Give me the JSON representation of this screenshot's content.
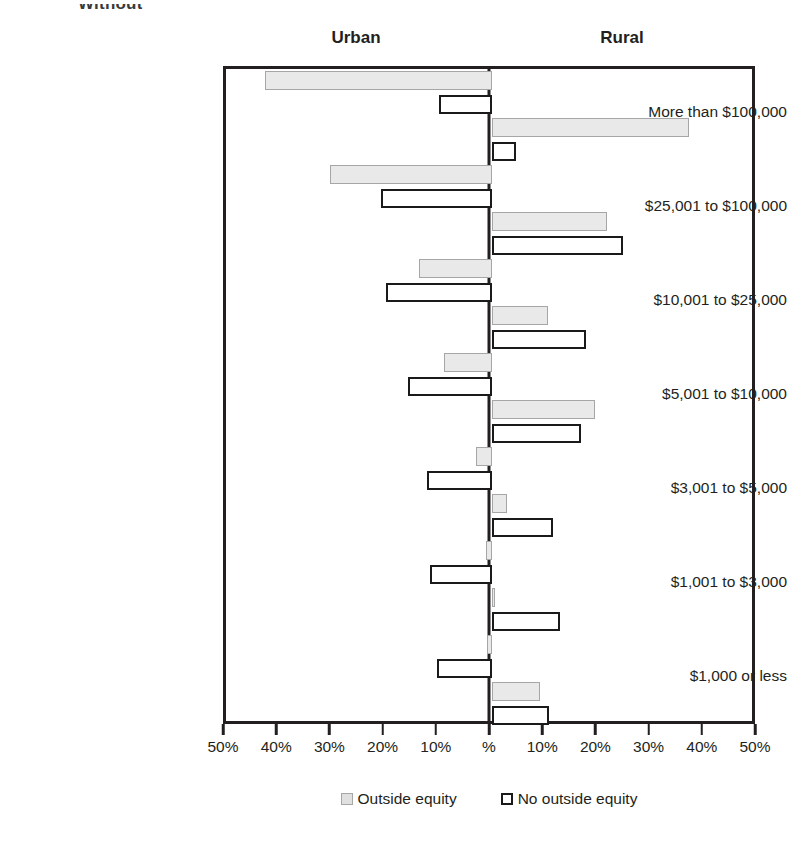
{
  "partial_title": "Without",
  "panels": {
    "left": "Urban",
    "right": "Rural"
  },
  "legend": [
    {
      "key": "outside_equity",
      "label": "Outside equity",
      "style": "gray"
    },
    {
      "key": "no_outside_equity",
      "label": "No outside equity",
      "style": "white"
    }
  ],
  "axis": {
    "ticks": [
      "50%",
      "40%",
      "30%",
      "20%",
      "10%",
      "%",
      "10%",
      "20%",
      "30%",
      "40%",
      "50%"
    ],
    "max": 50,
    "min": 0
  },
  "colors": {
    "outside_equity_fill": "#e9e9e9",
    "outside_equity_border": "#a6a6a6",
    "no_outside_equity_fill": "#ffffff",
    "no_outside_equity_border": "#1a1a1a",
    "frame": "#231f20",
    "text": "#231f20"
  },
  "chart_data": {
    "type": "bar",
    "orientation": "horizontal",
    "layout": "diverging-paired-panels",
    "title": "Without",
    "xlabel": "",
    "ylabel": "",
    "xlim": [
      -50,
      50
    ],
    "grid": false,
    "legend_position": "bottom",
    "panel_left": "Urban",
    "panel_right": "Rural",
    "categories": [
      "More than $100,000",
      "$25,001 to $100,000",
      "$10,001 to $25,000",
      "$5,001 to $10,000",
      "$3,001 to $5,000",
      "$1,001 to $3,000",
      "$1,000 or less"
    ],
    "series": [
      {
        "name": "Urban - Outside equity",
        "panel": "Urban",
        "style": "gray",
        "values": [
          42.7,
          30.5,
          13.7,
          9.0,
          3.0,
          1.1,
          1.0
        ]
      },
      {
        "name": "Urban - No outside equity",
        "panel": "Urban",
        "style": "white",
        "values": [
          10.0,
          20.9,
          19.9,
          15.8,
          12.2,
          11.7,
          10.3
        ]
      },
      {
        "name": "Rural - Outside equity",
        "panel": "Rural",
        "style": "gray",
        "values": [
          37.0,
          21.6,
          10.5,
          19.4,
          2.8,
          0.4,
          9.0
        ]
      },
      {
        "name": "Rural - No outside equity",
        "panel": "Rural",
        "style": "white",
        "values": [
          4.5,
          24.6,
          17.7,
          16.7,
          11.5,
          12.8,
          10.7
        ]
      }
    ]
  }
}
